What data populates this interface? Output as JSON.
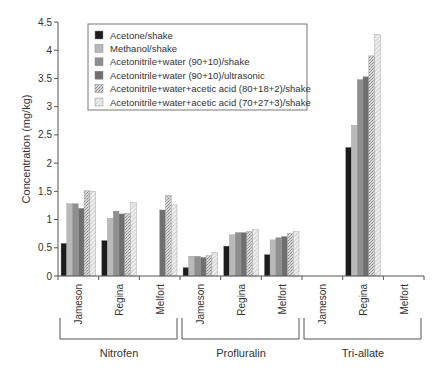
{
  "chart_data": {
    "type": "bar",
    "title": "",
    "xlabel": "",
    "ylabel": "Concentration (mg/kg)",
    "ylim": [
      0,
      4.5
    ],
    "yticks": [
      "0",
      "0.5",
      "1",
      "1.5",
      "2",
      "2.5",
      "3",
      "3.5",
      "4",
      "4.5"
    ],
    "grid": false,
    "legend_position": "upper-left inside",
    "groups": [
      {
        "name": "Nitrofen",
        "categories": [
          "Jameson",
          "Regina",
          "Melfort"
        ]
      },
      {
        "name": "Profluralin",
        "categories": [
          "Jameson",
          "Regina",
          "Melfort"
        ]
      },
      {
        "name": "Tri-allate",
        "categories": [
          "Jameson",
          "Regina",
          "Melfort"
        ]
      }
    ],
    "categories": [
      "Nitrofen / Jameson",
      "Nitrofen / Regina",
      "Nitrofen / Melfort",
      "Profluralin / Jameson",
      "Profluralin / Regina",
      "Profluralin / Melfort",
      "Tri-allate / Jameson",
      "Tri-allate / Regina",
      "Tri-allate / Melfort"
    ],
    "series": [
      {
        "name": "Acetone/shake",
        "fill": "#1c1c1c",
        "pattern": "solid",
        "values": [
          0.58,
          0.63,
          null,
          0.15,
          0.53,
          0.38,
          null,
          2.28,
          null
        ]
      },
      {
        "name": "Methanol/shake",
        "fill": "#b9b9b9",
        "pattern": "solid",
        "values": [
          1.28,
          1.02,
          null,
          0.35,
          0.73,
          0.64,
          null,
          2.67,
          null
        ]
      },
      {
        "name": "Acetonitrile+water (90+10)/shake",
        "fill": "#8f8f8f",
        "pattern": "solid",
        "values": [
          1.28,
          1.15,
          null,
          0.35,
          0.77,
          0.68,
          null,
          3.48,
          null
        ]
      },
      {
        "name": "Acetonitrile+water (90+10)/ultrasonic",
        "fill": "#6f6f6f",
        "pattern": "solid",
        "values": [
          1.2,
          1.1,
          1.17,
          0.33,
          0.77,
          0.7,
          null,
          3.53,
          null
        ]
      },
      {
        "name": "Acetonitrile+water+acetic acid (80+18+2)/shake",
        "fill": "#cfcfcf",
        "pattern": "crosshatch",
        "values": [
          1.51,
          1.11,
          1.43,
          0.36,
          0.79,
          0.76,
          null,
          3.9,
          null
        ]
      },
      {
        "name": "Acetonitrile+water+acetic acid (70+27+3)/shake",
        "fill": "#ececec",
        "pattern": "diagonal",
        "values": [
          1.5,
          1.3,
          1.26,
          0.42,
          0.82,
          0.79,
          null,
          4.28,
          null
        ]
      }
    ]
  },
  "axis": {
    "ylabel": "Concentration (mg/kg)"
  }
}
